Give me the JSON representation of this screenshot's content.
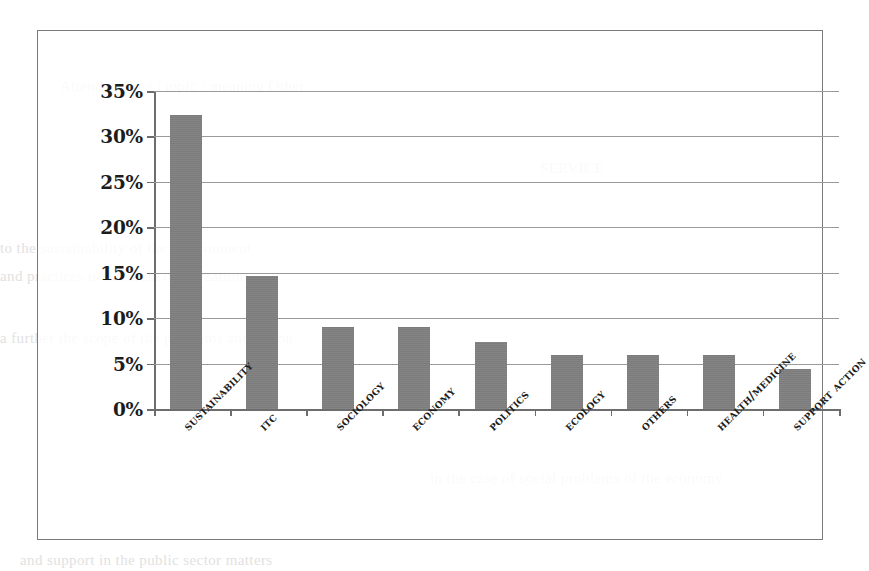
{
  "chart_data": {
    "type": "bar",
    "title": "",
    "subtitle": "",
    "xlabel": "",
    "ylabel": "",
    "ylim": [
      0,
      35
    ],
    "ytick_step": 5,
    "ytick_labels": [
      "35%",
      "30%",
      "25%",
      "20%",
      "15%",
      "10%",
      "5%",
      "0%"
    ],
    "ytick_values": [
      35,
      30,
      25,
      20,
      15,
      10,
      5,
      0
    ],
    "grid": true,
    "legend": "none",
    "bar_color": "#808080",
    "axis_color": "#6d6d6d",
    "gridline_color": "#9a9a9a",
    "categories": [
      "SUSTAINABILITY",
      "ITC",
      "SOCIOLOGY",
      "ECONOMY",
      "POLITICS",
      "ECOLOGY",
      "OTHERS",
      "HEALTH/MEDICINE",
      "SUPPORT ACTION"
    ],
    "values": [
      32.4,
      14.6,
      9.0,
      9.0,
      7.4,
      6.0,
      6.0,
      6.0,
      4.4
    ]
  },
  "page_ghost": {
    "lines": [
      "Attended        Area / topic / meaning        Other",
      "SERVICE",
      "to the sustainability    of the    environment",
      "and practices in different         organizations",
      "a further the scope of the problems and action",
      "in the case of social problems   of the economy",
      "and support in the   public   sector   matters"
    ]
  }
}
